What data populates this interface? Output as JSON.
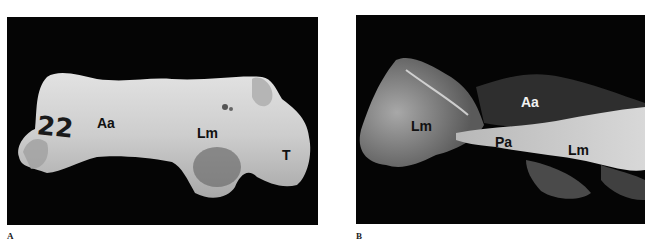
{
  "figure": {
    "panels": [
      {
        "id": "A",
        "letter": "A",
        "type": "photograph",
        "annotations": [
          {
            "text": "Aa",
            "style": "dark"
          },
          {
            "text": "Lm",
            "style": "dark"
          },
          {
            "text": "T",
            "style": "dark"
          }
        ],
        "specimen_mark": "22"
      },
      {
        "id": "B",
        "letter": "B",
        "type": "radiograph",
        "annotations": [
          {
            "text": "Lm",
            "style": "dark"
          },
          {
            "text": "Aa",
            "style": "light"
          },
          {
            "text": "Pa",
            "style": "dark"
          },
          {
            "text": "Lm",
            "style": "dark"
          }
        ]
      }
    ],
    "colors": {
      "background": "#ffffff",
      "panel_bg": "#050505",
      "bone_photo": "#cfcfcf",
      "bone_xray": "#9a9a9a"
    }
  }
}
